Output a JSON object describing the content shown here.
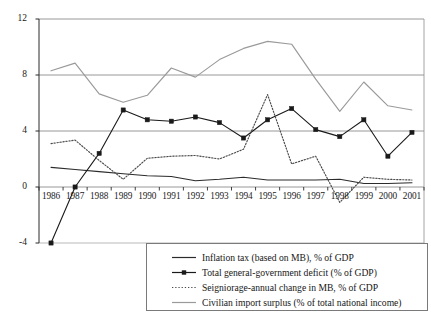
{
  "chart_data": {
    "type": "line",
    "title": "",
    "subtitle": "",
    "xlabel": "",
    "ylabel": "",
    "categories": [
      "1986",
      "1987",
      "1988",
      "1989",
      "1990",
      "1991",
      "1992",
      "1993",
      "1994",
      "1995",
      "1996",
      "1997",
      "1998",
      "1999",
      "2000",
      "2001"
    ],
    "x_tick_labels": [
      "1986",
      "1987",
      "1988",
      "1989",
      "1990",
      "1991",
      "1992",
      "1993",
      "1994",
      "1995",
      "1996",
      "1997",
      "1998",
      "1999",
      "2000",
      "2001"
    ],
    "y_tick_labels": [
      "12",
      "8",
      "4",
      "0",
      "-4"
    ],
    "y_ticks": [
      12,
      8,
      4,
      0,
      -4
    ],
    "ylim": [
      -4,
      12
    ],
    "xlim": [
      "1986",
      "2001"
    ],
    "grid": "horizontal-gridlines-at-0-4-8-12",
    "legend_position": "below-plot-centered",
    "series": [
      {
        "name": "Inflation tax (based on MB), % of GDP",
        "style": "solid",
        "color": "#2b2b2b",
        "marker": "none",
        "values": [
          1.4,
          1.25,
          1.1,
          0.95,
          0.8,
          0.75,
          0.45,
          0.55,
          0.7,
          0.5,
          0.5,
          0.5,
          0.55,
          0.25,
          0.25,
          0.3
        ]
      },
      {
        "name": "Total general-government deficit (% of GDP)",
        "style": "solid",
        "color": "#1a1a1a",
        "marker": "square",
        "values": [
          -4.0,
          0.0,
          2.4,
          5.5,
          4.8,
          4.7,
          5.0,
          4.6,
          3.5,
          4.8,
          5.6,
          4.1,
          3.6,
          4.8,
          2.2,
          3.9
        ]
      },
      {
        "name": "Seigniorage-annual change in MB, % of GDP",
        "style": "dotted",
        "color": "#4a4a4a",
        "marker": "none",
        "values": [
          3.1,
          3.35,
          1.9,
          0.55,
          2.05,
          2.2,
          2.25,
          2.0,
          2.7,
          6.6,
          1.65,
          2.2,
          -1.1,
          0.7,
          0.55,
          0.5
        ]
      },
      {
        "name": "Civilian import surplus (% of total national income)",
        "style": "solid",
        "color": "#9a9a9a",
        "marker": "none",
        "values": [
          8.3,
          8.85,
          6.65,
          6.05,
          6.55,
          8.5,
          7.85,
          9.1,
          9.9,
          10.4,
          10.2,
          7.7,
          5.4,
          7.5,
          5.8,
          5.5
        ]
      }
    ]
  },
  "legend": {
    "items": [
      {
        "label": "Inflation tax (based on MB), % of GDP",
        "swatch": "solid-dark-line"
      },
      {
        "label": "Total general-government deficit (% of GDP)",
        "swatch": "solid-dark-line-with-square-marker"
      },
      {
        "label": "Seigniorage-annual change in MB, % of GDP",
        "swatch": "dotted-line"
      },
      {
        "label": "Civilian import surplus (% of total national income)",
        "swatch": "solid-gray-line"
      }
    ]
  }
}
